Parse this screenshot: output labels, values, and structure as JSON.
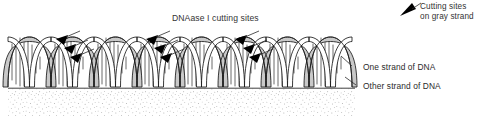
{
  "figure": {
    "width": 477,
    "height": 123,
    "background_color": "#ffffff",
    "title": "DNAase I cutting sites",
    "labels": {
      "one_strand": "One strand of DNA",
      "other_strand": "Other strand of DNA"
    },
    "legend": {
      "line1": "Cutting sites",
      "line2": "on gray strand",
      "marker": "black-triangle-arrow"
    },
    "colors": {
      "outline": "#1a1a1a",
      "gray_strand_fill": "#c9c9c9",
      "white_strand_fill": "#ffffff",
      "text": "#2b2b2b",
      "stipple": "#8c8c8c",
      "baseline": "#2a2a2a",
      "arrow_fill": "#000000"
    },
    "helix": {
      "description": "DNA double helix drawn in side view with a gray ribbon strand and a white ribbon strand, connected by vertical base-pair rungs, resting on a stippled surface",
      "turns": 8,
      "x_start": 8,
      "x_end": 352,
      "top_y": 37,
      "bottom_y": 87,
      "period": 43
    },
    "cut_site_groups": [
      {
        "id": "group-1",
        "arrow_count": 3,
        "anchor_x": 62,
        "anchor_y": 38
      },
      {
        "id": "group-2",
        "arrow_count": 3,
        "anchor_x": 152,
        "anchor_y": 38
      },
      {
        "id": "group-3",
        "arrow_count": 3,
        "anchor_x": 241,
        "anchor_y": 38
      }
    ],
    "surface": {
      "name": "stippled-surface",
      "top_y": 88,
      "bottom_y": 116,
      "x_start": 8,
      "x_end": 355,
      "texture": "random-stipple-dots"
    }
  }
}
